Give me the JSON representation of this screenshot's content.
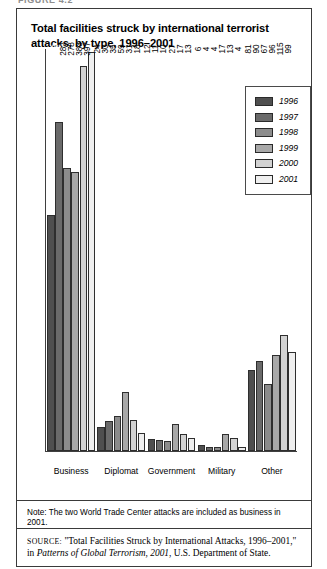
{
  "figure_label": "FIGURE 4.2",
  "chart": {
    "title": "Total facilities struck by international terrorist attacks, by type, 1996–2001"
  },
  "legend": {
    "position": "top-right-inside",
    "entries": [
      {
        "label": "1996",
        "color": "#4f4f4f"
      },
      {
        "label": "1997",
        "color": "#6a6a6a"
      },
      {
        "label": "1998",
        "color": "#8c8c8c"
      },
      {
        "label": "1999",
        "color": "#a8a8a8"
      },
      {
        "label": "2000",
        "color": "#d2d2d2"
      },
      {
        "label": "2001",
        "color": "#efefef"
      }
    ]
  },
  "note": {
    "text": "Note: The two World Trade Center attacks are included as business in 2001."
  },
  "source": {
    "prefix": "SOURCE:",
    "quoted_title": "\"Total Facilities Struck by International Attacks, 1996–2001,\" in",
    "publication": "Patterns of Global Terrorism, 2001",
    "suffix": ", U.S. Department of State."
  },
  "chart_data": {
    "type": "bar",
    "title": "Total facilities struck by international terrorist attacks, by type, 1996–2001",
    "xlabel": "",
    "ylabel": "",
    "ylim": [
      0,
      400
    ],
    "grid": false,
    "legend_position": "upper right",
    "categories": [
      "Business",
      "Diplomat",
      "Government",
      "Military",
      "Other"
    ],
    "series": [
      {
        "name": "1996",
        "color": "#4f4f4f",
        "values": [
          235,
          24,
          12,
          6,
          81
        ]
      },
      {
        "name": "1997",
        "color": "#6a6a6a",
        "values": [
          327,
          30,
          11,
          4,
          90
        ]
      },
      {
        "name": "1998",
        "color": "#8c8c8c",
        "values": [
          282,
          35,
          10,
          4,
          67
        ]
      },
      {
        "name": "1999",
        "color": "#a8a8a8",
        "values": [
          278,
          59,
          27,
          17,
          96
        ]
      },
      {
        "name": "2000",
        "color": "#d2d2d2",
        "values": [
          383,
          31,
          17,
          13,
          115
        ]
      },
      {
        "name": "2001",
        "color": "#efefef",
        "values": [
          397,
          18,
          13,
          4,
          99
        ]
      }
    ]
  }
}
